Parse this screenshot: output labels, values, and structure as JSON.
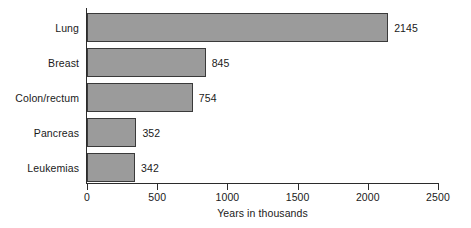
{
  "chart_data": {
    "type": "bar",
    "orientation": "horizontal",
    "title": "",
    "subtitle": "",
    "xlabel": "Years in thousands",
    "ylabel": "",
    "categories": [
      "Lung",
      "Breast",
      "Colon/rectum",
      "Pancreas",
      "Leukemias"
    ],
    "values": [
      2145,
      845,
      754,
      352,
      342
    ],
    "value_labels": [
      "2145",
      "845",
      "754",
      "352",
      "342"
    ],
    "xlim": [
      0,
      2500
    ],
    "xticks": [
      0,
      500,
      1000,
      1500,
      2000,
      2500
    ],
    "xtick_labels": [
      "0",
      "500",
      "1000",
      "1500",
      "2000",
      "2500"
    ],
    "grid": false,
    "legend": null,
    "legend_position": "none",
    "annotations": [],
    "colors": {
      "bar_fill": "#9b9b9b",
      "bar_edge": "#3a3a3a",
      "axis": "#2b2b2b",
      "text": "#1a1a1a",
      "background": "#ffffff"
    }
  }
}
